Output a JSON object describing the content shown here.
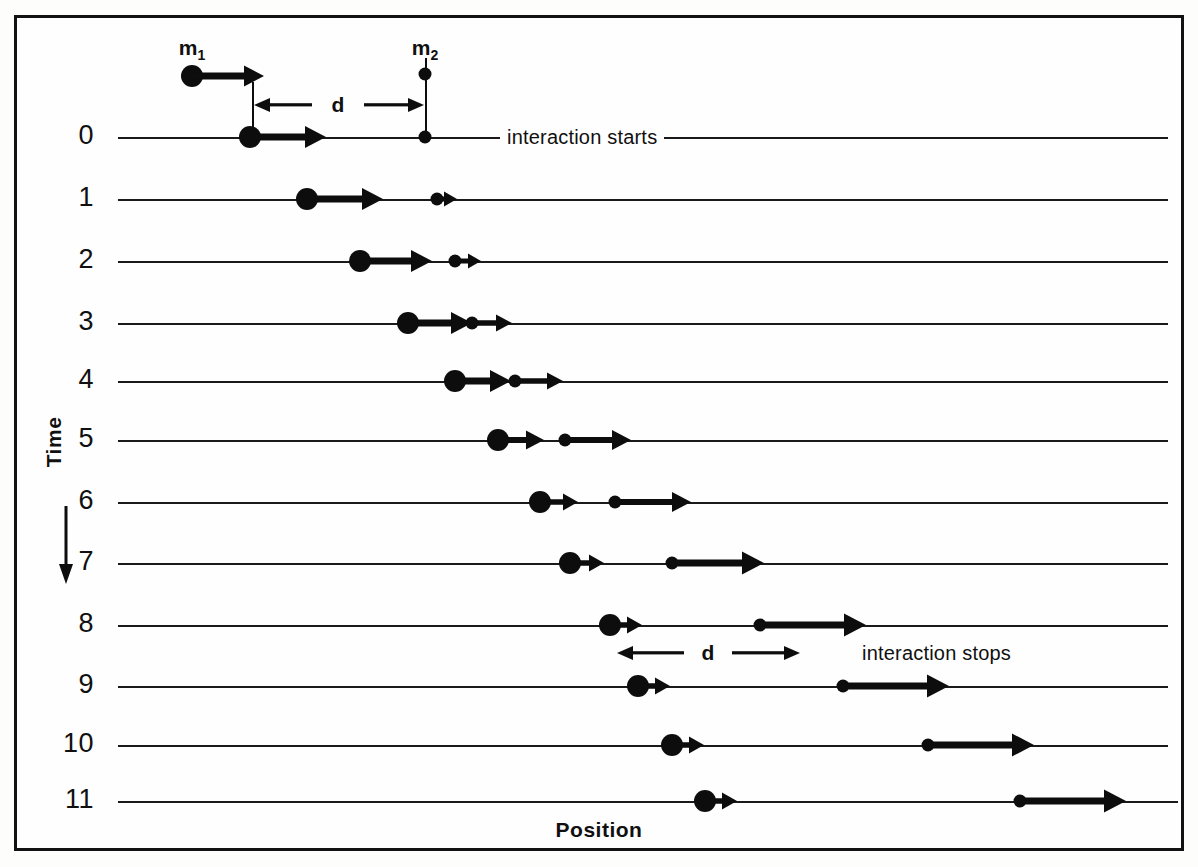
{
  "figure": {
    "axis_time_label": "Time",
    "axis_position_label": "Position",
    "mass1_label": "m",
    "mass1_sub": "1",
    "mass2_label": "m",
    "mass2_sub": "2",
    "distance_label_top": "d",
    "distance_label_bottom": "d",
    "note_start": "interaction starts",
    "note_stop": "interaction stops",
    "ink_color": "#0d0d0d",
    "paper_color": "#fefefe"
  },
  "chart_data": {
    "type": "line",
    "title": "",
    "xlabel": "Position",
    "ylabel": "Time",
    "grid": false,
    "legend": "none",
    "time_labels": [
      "0",
      "1",
      "2",
      "3",
      "4",
      "5",
      "6",
      "7",
      "8",
      "9",
      "10",
      "11"
    ],
    "interaction_start_time": 0,
    "interaction_stop_time": 8,
    "separation_distance_symbol": "d",
    "series": [
      {
        "name": "m1",
        "mass": "heavy",
        "positions": [
          250,
          307,
          360,
          408,
          455,
          498,
          540,
          570,
          610,
          638,
          672,
          705
        ],
        "speeds": [
          72,
          72,
          68,
          60,
          52,
          42,
          34,
          30,
          28,
          28,
          28,
          28
        ]
      },
      {
        "name": "m2",
        "mass": "light",
        "positions": [
          425,
          437,
          455,
          472,
          515,
          565,
          615,
          672,
          760,
          843,
          928,
          1020
        ],
        "speeds": [
          0,
          18,
          24,
          38,
          46,
          64,
          74,
          90,
          104,
          104,
          104,
          104
        ]
      }
    ],
    "annotations": [
      {
        "text": "interaction starts",
        "time": 0,
        "x": 500
      },
      {
        "text": "interaction stops",
        "time": 8,
        "x": 855
      },
      {
        "text": "d",
        "between_time": "pre-0",
        "from_x": 252,
        "to_x": 425
      },
      {
        "text": "d",
        "between_time": "8-9",
        "from_x": 617,
        "to_x": 800
      }
    ]
  },
  "rows": [
    {
      "t": "0",
      "y": 137,
      "line_from": 118,
      "line_to": 1168,
      "m1_x": 250,
      "m1_len": 72,
      "m2_x": 425,
      "m2_len": 0
    },
    {
      "t": "1",
      "y": 199,
      "line_from": 118,
      "line_to": 1168,
      "m1_x": 307,
      "m1_len": 72,
      "m2_x": 437,
      "m2_len": 18
    },
    {
      "t": "2",
      "y": 261,
      "line_from": 118,
      "line_to": 1168,
      "m1_x": 360,
      "m1_len": 68,
      "m2_x": 455,
      "m2_len": 24
    },
    {
      "t": "3",
      "y": 323,
      "line_from": 118,
      "line_to": 1168,
      "m1_x": 408,
      "m1_len": 60,
      "m2_x": 472,
      "m2_len": 38
    },
    {
      "t": "4",
      "y": 381,
      "line_from": 118,
      "line_to": 1168,
      "m1_x": 455,
      "m1_len": 52,
      "m2_x": 515,
      "m2_len": 46
    },
    {
      "t": "5",
      "y": 440,
      "line_from": 118,
      "line_to": 1168,
      "m1_x": 498,
      "m1_len": 42,
      "m2_x": 565,
      "m2_len": 64
    },
    {
      "t": "6",
      "y": 502,
      "line_from": 118,
      "line_to": 1168,
      "m1_x": 540,
      "m1_len": 34,
      "m2_x": 615,
      "m2_len": 74
    },
    {
      "t": "7",
      "y": 563,
      "line_from": 118,
      "line_to": 1168,
      "m1_x": 570,
      "m1_len": 30,
      "m2_x": 672,
      "m2_len": 90
    },
    {
      "t": "8",
      "y": 625,
      "line_from": 118,
      "line_to": 1168,
      "m1_x": 610,
      "m1_len": 28,
      "m2_x": 760,
      "m2_len": 104
    },
    {
      "t": "9",
      "y": 686,
      "line_from": 118,
      "line_to": 1168,
      "m1_x": 638,
      "m1_len": 28,
      "m2_x": 843,
      "m2_len": 104
    },
    {
      "t": "10",
      "y": 745,
      "line_from": 118,
      "line_to": 1168,
      "m1_x": 672,
      "m1_len": 28,
      "m2_x": 928,
      "m2_len": 104
    },
    {
      "t": "11",
      "y": 801,
      "line_from": 118,
      "line_to": 1178,
      "m1_x": 705,
      "m1_len": 28,
      "m2_x": 1020,
      "m2_len": 104
    }
  ],
  "header": {
    "m1_tag_x": 192,
    "m1_tag_y": 36,
    "m1_ball_x": 192,
    "m1_ball_y": 76,
    "m1_len": 72,
    "m2_tag_x": 425,
    "m2_tag_y": 36,
    "m2_ball_x": 425,
    "m2_ball_y": 74
  },
  "dim_top": {
    "left_x": 252,
    "right_x": 425,
    "y": 105,
    "tick_top": 82,
    "tick_bottom": 137,
    "label_x": 338
  },
  "dim_bottom": {
    "left_x": 617,
    "right_x": 800,
    "y": 653,
    "label_x": 708
  }
}
